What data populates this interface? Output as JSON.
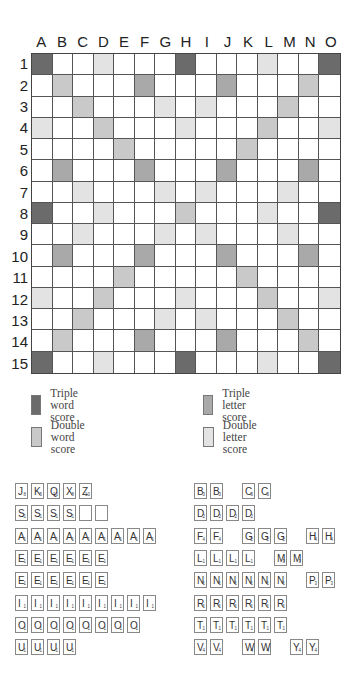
{
  "board": {
    "columns": [
      "A",
      "B",
      "C",
      "D",
      "E",
      "F",
      "G",
      "H",
      "I",
      "J",
      "K",
      "L",
      "M",
      "N",
      "O"
    ],
    "rows": [
      "1",
      "2",
      "3",
      "4",
      "5",
      "6",
      "7",
      "8",
      "9",
      "10",
      "11",
      "12",
      "13",
      "14",
      "15"
    ],
    "layout": [
      "T..d...T...d..T",
      ".D...t...t...D.",
      "..D...d.d...D..",
      "d..D...d...D..d",
      "....D.....D....",
      ".t...t...t...t.",
      "..d...d.d...d..",
      "T..d...D...d..T",
      "..d...d.d...d..",
      ".t...t...t...t.",
      "....D.....D....",
      "d..D...d...D..d",
      "..D...d.d...D..",
      ".D...t...t...D.",
      "T..d...T...d..T"
    ],
    "layout_key": {
      "T": "triple-word",
      "t": "triple-letter",
      "D": "double-word",
      "d": "double-letter",
      ".": "plain"
    }
  },
  "legend": [
    {
      "key": "triple-word",
      "label": "Triple word score",
      "color": "#6b6b6b"
    },
    {
      "key": "triple-letter",
      "label": "Triple letter score",
      "color": "#a9a9a9"
    },
    {
      "key": "double-word",
      "label": "Double word score",
      "color": "#c9c9c9"
    },
    {
      "key": "double-letter",
      "label": "Double letter score",
      "color": "#e3e3e3"
    }
  ],
  "tile_sets": {
    "left": [
      [
        [
          "J",
          "8"
        ],
        [
          "K",
          "5"
        ],
        [
          "Q",
          "10"
        ],
        [
          "X",
          "8"
        ],
        [
          "Z",
          "10"
        ]
      ],
      [
        [
          "S",
          "1"
        ],
        [
          "S",
          "1"
        ],
        [
          "S",
          "1"
        ],
        [
          "S",
          "1"
        ],
        [
          "",
          ""
        ],
        [
          "",
          ""
        ]
      ],
      [
        [
          "A",
          "1"
        ],
        [
          "A",
          "1"
        ],
        [
          "A",
          "1"
        ],
        [
          "A",
          "1"
        ],
        [
          "A",
          "1"
        ],
        [
          "A",
          "1"
        ],
        [
          "A",
          "1"
        ],
        [
          "A",
          "1"
        ],
        [
          "A",
          "1"
        ]
      ],
      [
        [
          "E",
          "1"
        ],
        [
          "E",
          "1"
        ],
        [
          "E",
          "1"
        ],
        [
          "E",
          "1"
        ],
        [
          "E",
          "1"
        ],
        [
          "E",
          "1"
        ]
      ],
      [
        [
          "E",
          "1"
        ],
        [
          "E",
          "1"
        ],
        [
          "E",
          "1"
        ],
        [
          "E",
          "1"
        ],
        [
          "E",
          "1"
        ],
        [
          "E",
          "1"
        ]
      ],
      [
        [
          "I",
          "1"
        ],
        [
          "I",
          "1"
        ],
        [
          "I",
          "1"
        ],
        [
          "I",
          "1"
        ],
        [
          "I",
          "1"
        ],
        [
          "I",
          "1"
        ],
        [
          "I",
          "1"
        ],
        [
          "I",
          "1"
        ],
        [
          "I",
          "1"
        ]
      ],
      [
        [
          "O",
          "1"
        ],
        [
          "O",
          "1"
        ],
        [
          "O",
          "1"
        ],
        [
          "O",
          "1"
        ],
        [
          "O",
          "1"
        ],
        [
          "O",
          "1"
        ],
        [
          "O",
          "1"
        ],
        [
          "O",
          "1"
        ]
      ],
      [
        [
          "U",
          "1"
        ],
        [
          "U",
          "1"
        ],
        [
          "U",
          "1"
        ],
        [
          "U",
          "1"
        ]
      ]
    ],
    "right": [
      [
        [
          "B",
          "3"
        ],
        [
          "B",
          "3"
        ],
        null,
        [
          "C",
          "3"
        ],
        [
          "C",
          "3"
        ]
      ],
      [
        [
          "D",
          "2"
        ],
        [
          "D",
          "2"
        ],
        [
          "D",
          "2"
        ],
        [
          "D",
          "2"
        ]
      ],
      [
        [
          "F",
          "4"
        ],
        [
          "F",
          "4"
        ],
        null,
        [
          "G",
          "2"
        ],
        [
          "G",
          "2"
        ],
        [
          "G",
          "2"
        ],
        null,
        [
          "H",
          "4"
        ],
        [
          "H",
          "4"
        ]
      ],
      [
        [
          "L",
          "1"
        ],
        [
          "L",
          "1"
        ],
        [
          "L",
          "1"
        ],
        [
          "L",
          "1"
        ],
        null,
        [
          "M",
          "3"
        ],
        [
          "M",
          "3"
        ]
      ],
      [
        [
          "N",
          "1"
        ],
        [
          "N",
          "1"
        ],
        [
          "N",
          "1"
        ],
        [
          "N",
          "1"
        ],
        [
          "N",
          "1"
        ],
        [
          "N",
          "1"
        ],
        null,
        [
          "P",
          "3"
        ],
        [
          "P",
          "3"
        ]
      ],
      [
        [
          "R",
          "1"
        ],
        [
          "R",
          "1"
        ],
        [
          "R",
          "1"
        ],
        [
          "R",
          "1"
        ],
        [
          "R",
          "1"
        ],
        [
          "R",
          "1"
        ]
      ],
      [
        [
          "T",
          "1"
        ],
        [
          "T",
          "1"
        ],
        [
          "T",
          "1"
        ],
        [
          "T",
          "1"
        ],
        [
          "T",
          "1"
        ],
        [
          "T",
          "1"
        ]
      ],
      [
        [
          "V",
          "4"
        ],
        [
          "V",
          "4"
        ],
        null,
        [
          "W",
          "4"
        ],
        [
          "W",
          "4"
        ],
        null,
        [
          "Y",
          "4"
        ],
        [
          "Y",
          "4"
        ]
      ]
    ]
  }
}
